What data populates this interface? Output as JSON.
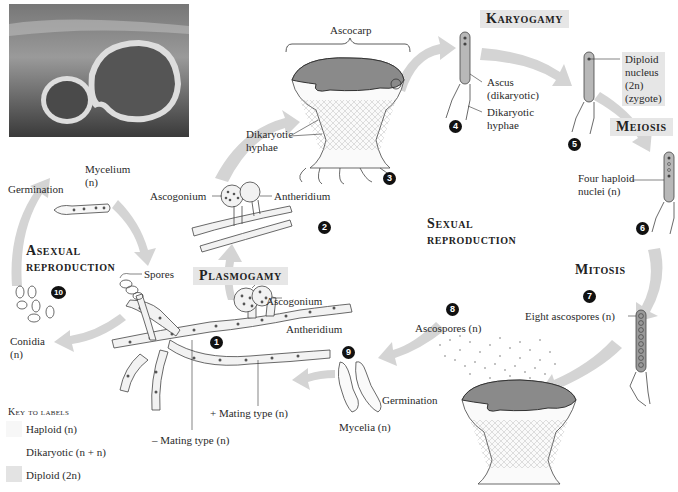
{
  "figure": {
    "photo_alt": "photo-of-cup-fungi"
  },
  "stage_titles": {
    "karyogamy": "Karyogamy",
    "meiosis": "Meiosis",
    "mitosis": "Mitosis",
    "plasmogamy": "Plasmogamy",
    "sexual_line1": "Sexual",
    "sexual_line2": "reproduction",
    "asexual_line1": "Asexual",
    "asexual_line2": "reproduction"
  },
  "labels": {
    "ascocarp": "Ascocarp",
    "dikaryotic_hyphae_left_1": "Dikaryotic",
    "dikaryotic_hyphae_left_2": "hyphae",
    "ascus_1": "Ascus",
    "ascus_2": "(dikaryotic)",
    "dikaryotic_hyphae_right_1": "Dikaryotic",
    "dikaryotic_hyphae_right_2": "hyphae",
    "diploid_1": "Diploid",
    "diploid_2": "nucleus",
    "diploid_3": "(2n)",
    "diploid_4": "(zygote)",
    "four_haploid_1": "Four haploid",
    "four_haploid_2": "nuclei (n)",
    "eight_ascospores": "Eight ascospores (n)",
    "ascospores": "Ascospores (n)",
    "germination_right": "Germination",
    "mycelia": "Mycelia (n)",
    "plus_mating": "+ Mating type (n)",
    "minus_mating": "– Mating type (n)",
    "ascogonium_top": "Ascogonium",
    "antheridium_top": "Antheridium",
    "ascogonium_bottom": "Ascogonium",
    "antheridium_bottom": "Antheridium",
    "spores": "Spores",
    "conidia_1": "Conidia",
    "conidia_2": "(n)",
    "germination_left": "Germination",
    "mycelium_1": "Mycelium",
    "mycelium_2": "(n)"
  },
  "step_numbers": [
    "1",
    "2",
    "3",
    "4",
    "5",
    "6",
    "7",
    "8",
    "9",
    "10"
  ],
  "key": {
    "title": "Key to labels",
    "items": [
      {
        "label": "Haploid (n)",
        "color": "#f7f7f7"
      },
      {
        "label": "Dikaryotic (n + n)",
        "color": "#ffffff"
      },
      {
        "label": "Diploid (2n)",
        "color": "#e3e3e3"
      }
    ]
  },
  "colors": {
    "arrow": "#d4d4d4",
    "title_box": "#e6e6e6",
    "ascus_fill": "#b8b8b8",
    "cap_fill": "#8a8a8a",
    "number_bg": "#111111"
  }
}
